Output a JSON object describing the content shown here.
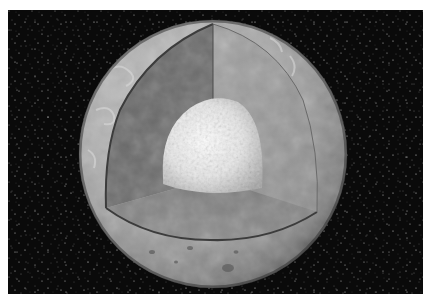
{
  "image": {
    "subject": "Cutaway illustration of a planetary body showing crust, mantle and core",
    "background": "starfield",
    "colors": {
      "space": "#0a0a0a",
      "surface": "#a8a8a8",
      "mantle_left": "#6e6e6e",
      "mantle_right": "#9c9c9c",
      "mantle_bottom": "#848484",
      "core": "#f2f2f2"
    },
    "layers": [
      "crust",
      "mantle",
      "core"
    ]
  }
}
